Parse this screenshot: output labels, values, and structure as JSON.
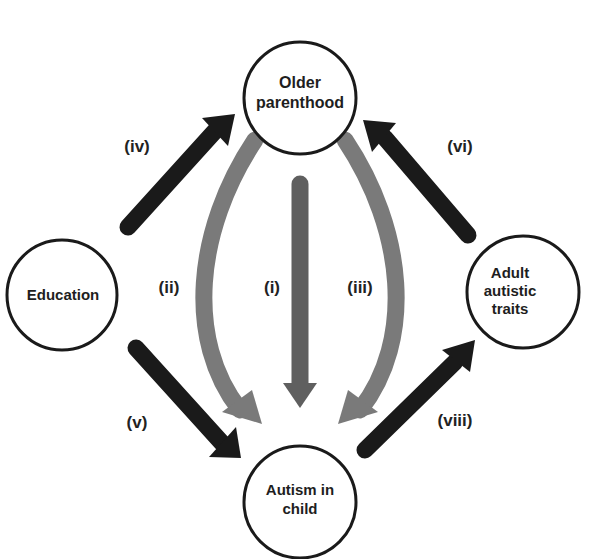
{
  "diagram": {
    "type": "causal-path-diagram",
    "colors": {
      "background": "#ffffff",
      "node_stroke": "#1a1a1a",
      "dark_arrow": "#1a1a1a",
      "gray_arrow": "#7a7a7a",
      "mid_arrow": "#5f5f5f",
      "text": "#1e1e1e"
    },
    "nodes": {
      "older_parenthood": {
        "line1": "Older",
        "line2": "parenthood"
      },
      "education": {
        "line1": "Education"
      },
      "adult_traits": {
        "line1": "Adult",
        "line2": "autistic",
        "line3": "traits"
      },
      "autism_child": {
        "line1": "Autism in",
        "line2": "child"
      }
    },
    "paths": {
      "i": {
        "label": "(i)",
        "from": "Older parenthood",
        "to": "Autism in child"
      },
      "ii": {
        "label": "(ii)",
        "from": "Older parenthood",
        "to": "Autism in child"
      },
      "iii": {
        "label": "(iii)",
        "from": "Older parenthood",
        "to": "Autism in child"
      },
      "iv": {
        "label": "(iv)",
        "from": "Education",
        "to": "Older parenthood"
      },
      "v": {
        "label": "(v)",
        "from": "Education",
        "to": "Autism in child"
      },
      "vi": {
        "label": "(vi)",
        "from": "Adult autistic traits",
        "to": "Older parenthood"
      },
      "viii": {
        "label": "(viii)",
        "from": "Autism in child",
        "to": "Adult autistic traits"
      }
    }
  }
}
